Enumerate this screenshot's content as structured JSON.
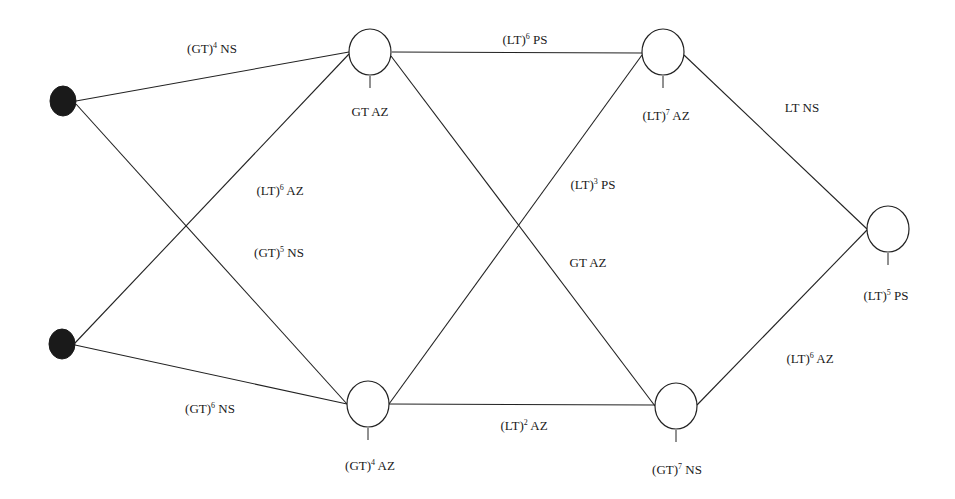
{
  "diagram": {
    "type": "network",
    "colors": {
      "stroke": "#222222",
      "source_fill": "#1a1a1a",
      "node_fill": "#ffffff",
      "background": "#ffffff"
    },
    "sources": [
      {
        "id": "S1",
        "cx": 63,
        "cy": 101,
        "rx": 13,
        "ry": 15
      },
      {
        "id": "S2",
        "cx": 62,
        "cy": 344,
        "rx": 13,
        "ry": 15
      }
    ],
    "nodes": [
      {
        "id": "N1",
        "cx": 370,
        "cy": 52,
        "r": 21,
        "label_base": "GT AZ",
        "label_pre": "GT",
        "label_exp": "",
        "label_post": " AZ",
        "label_x": 370,
        "label_y": 116
      },
      {
        "id": "N2",
        "cx": 663,
        "cy": 52,
        "r": 21,
        "label_pre": "(LT)",
        "label_exp": "7",
        "label_post": " AZ",
        "label_x": 666,
        "label_y": 120
      },
      {
        "id": "N3",
        "cx": 888,
        "cy": 229,
        "r": 21,
        "label_pre": "(LT)",
        "label_exp": "5",
        "label_post": " PS",
        "label_x": 886,
        "label_y": 300
      },
      {
        "id": "N4",
        "cx": 368,
        "cy": 404,
        "r": 21,
        "label_pre": "(GT)",
        "label_exp": "4",
        "label_post": " AZ",
        "label_x": 370,
        "label_y": 470
      },
      {
        "id": "N5",
        "cx": 676,
        "cy": 406,
        "r": 21,
        "label_pre": "(GT)",
        "label_exp": "7",
        "label_post": " NS",
        "label_x": 677,
        "label_y": 474
      }
    ],
    "edges": [
      {
        "from": "S1",
        "to": "N1",
        "x1": 76,
        "y1": 101,
        "x2": 349,
        "y2": 52,
        "label_pre": "(GT)",
        "label_exp": "4",
        "label_post": " NS",
        "label_x": 212,
        "label_y": 53
      },
      {
        "from": "S1",
        "to": "N4",
        "x1": 76,
        "y1": 104,
        "x2": 347,
        "y2": 404,
        "label_pre": "(GT)",
        "label_exp": "5",
        "label_post": " NS",
        "label_x": 279,
        "label_y": 257
      },
      {
        "from": "S2",
        "to": "N1",
        "x1": 75,
        "y1": 343,
        "x2": 349,
        "y2": 54,
        "label_pre": "(LT)",
        "label_exp": "6",
        "label_post": " AZ",
        "label_x": 280,
        "label_y": 195
      },
      {
        "from": "S2",
        "to": "N4",
        "x1": 75,
        "y1": 345,
        "x2": 347,
        "y2": 404,
        "label_pre": "(GT)",
        "label_exp": "6",
        "label_post": " NS",
        "label_x": 210,
        "label_y": 413
      },
      {
        "from": "N1",
        "to": "N2",
        "x1": 392,
        "y1": 52,
        "x2": 642,
        "y2": 53,
        "label_pre": "(LT)",
        "label_exp": "6",
        "label_post": " PS",
        "label_x": 525,
        "label_y": 44
      },
      {
        "from": "N1",
        "to": "N5",
        "x1": 391,
        "y1": 56,
        "x2": 655,
        "y2": 406,
        "label_pre": "GT",
        "label_exp": "",
        "label_post": " AZ",
        "label_x": 588,
        "label_y": 267
      },
      {
        "from": "N4",
        "to": "N2",
        "x1": 389,
        "y1": 404,
        "x2": 642,
        "y2": 55,
        "label_pre": "(LT)",
        "label_exp": "3",
        "label_post": " PS",
        "label_x": 593,
        "label_y": 189
      },
      {
        "from": "N4",
        "to": "N5",
        "x1": 389,
        "y1": 404,
        "x2": 655,
        "y2": 405,
        "label_pre": "(LT)",
        "label_exp": "2",
        "label_post": " AZ",
        "label_x": 524,
        "label_y": 430
      },
      {
        "from": "N2",
        "to": "N3",
        "x1": 684,
        "y1": 55,
        "x2": 867,
        "y2": 229,
        "label_pre": "LT",
        "label_exp": "",
        "label_post": " NS",
        "label_x": 802,
        "label_y": 112
      },
      {
        "from": "N5",
        "to": "N3",
        "x1": 697,
        "y1": 405,
        "x2": 867,
        "y2": 230,
        "label_pre": "(LT)",
        "label_exp": "6",
        "label_post": " AZ",
        "label_x": 810,
        "label_y": 363
      }
    ]
  }
}
